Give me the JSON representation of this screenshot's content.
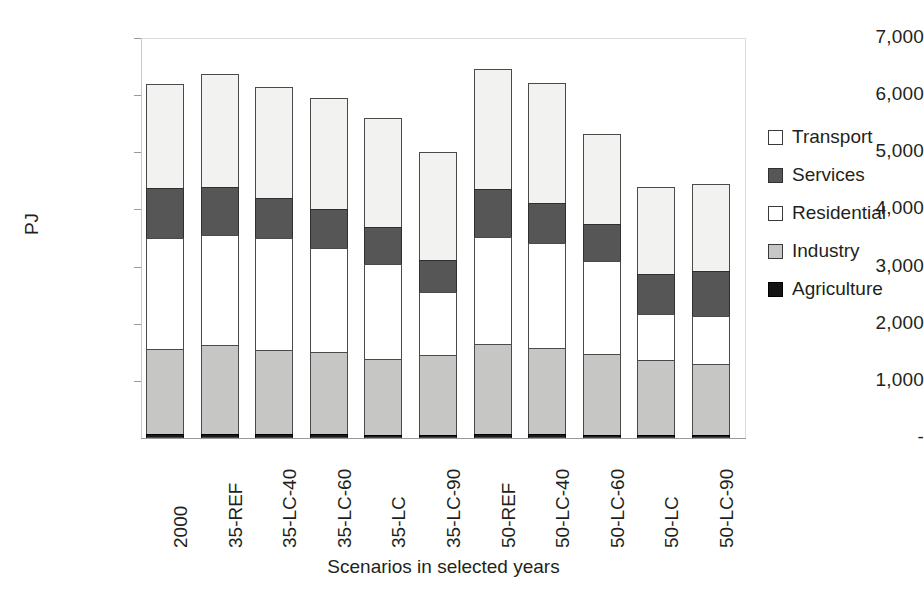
{
  "chart_data": {
    "type": "bar",
    "subtype": "stacked-bar",
    "title": "",
    "xlabel": "Scenarios in selected years",
    "ylabel": "PJ",
    "units": "PJ",
    "ylim": [
      0,
      7000
    ],
    "ytick_values": [
      0,
      1000,
      2000,
      3000,
      4000,
      5000,
      6000,
      7000
    ],
    "ytick_labels": [
      "-",
      "1,000",
      "2,000",
      "3,000",
      "4,000",
      "5,000",
      "6,000",
      "7,000"
    ],
    "grid": false,
    "legend_position": "right",
    "legend_order_top_to_bottom": [
      "Transport",
      "Services",
      "Residential",
      "Industry",
      "Agriculture"
    ],
    "stack_order_bottom_to_top": [
      "Agriculture",
      "Industry",
      "Residential",
      "Services",
      "Transport"
    ],
    "categories": [
      "2000",
      "35-REF",
      "35-LC-40",
      "35-LC-60",
      "35-LC",
      "35-LC-90",
      "50-REF",
      "50-LC-40",
      "50-LC-60",
      "50-LC",
      "50-LC-90"
    ],
    "series": [
      {
        "name": "Agriculture",
        "color": "#1a1a1a",
        "values": [
          70,
          70,
          70,
          70,
          60,
          60,
          70,
          70,
          60,
          60,
          60
        ]
      },
      {
        "name": "Industry",
        "color": "#c6c6c5",
        "values": [
          1490,
          1550,
          1470,
          1440,
          1330,
          1390,
          1570,
          1510,
          1410,
          1300,
          1230
        ]
      },
      {
        "name": "Residential",
        "color": "#ffffff",
        "values": [
          1940,
          1930,
          1960,
          1820,
          1660,
          1110,
          1880,
          1830,
          1630,
          810,
          850
        ]
      },
      {
        "name": "Services",
        "color": "#565656",
        "values": [
          875,
          850,
          700,
          670,
          640,
          560,
          840,
          700,
          640,
          700,
          780
        ]
      },
      {
        "name": "Transport",
        "color": "#f2f2f1",
        "values": [
          1825,
          1970,
          1950,
          1950,
          1910,
          1880,
          2090,
          2110,
          1580,
          1530,
          1520
        ]
      }
    ],
    "totals": [
      6200,
      6370,
      6150,
      5950,
      5600,
      5000,
      6450,
      6220,
      5320,
      4400,
      4440
    ]
  },
  "axes": {
    "y": {
      "label": "PJ",
      "ticks": [
        {
          "label": "7,000",
          "value": 7000
        },
        {
          "label": "6,000",
          "value": 6000
        },
        {
          "label": "5,000",
          "value": 5000
        },
        {
          "label": "4,000",
          "value": 4000
        },
        {
          "label": "3,000",
          "value": 3000
        },
        {
          "label": "2,000",
          "value": 2000
        },
        {
          "label": "1,000",
          "value": 1000
        },
        {
          "label": "-",
          "value": 0
        }
      ]
    },
    "x": {
      "title": "Scenarios in selected years",
      "ticks": [
        {
          "label": "2000"
        },
        {
          "label": "35-REF"
        },
        {
          "label": "35-LC-40"
        },
        {
          "label": "35-LC-60"
        },
        {
          "label": "35-LC"
        },
        {
          "label": "35-LC-90"
        },
        {
          "label": "50-REF"
        },
        {
          "label": "50-LC-40"
        },
        {
          "label": "50-LC-60"
        },
        {
          "label": "50-LC"
        },
        {
          "label": "50-LC-90"
        }
      ]
    }
  },
  "legend": {
    "items": [
      {
        "label": "Transport",
        "swatch": "legend-swatch-transport",
        "color": "#ffffff"
      },
      {
        "label": "Services",
        "swatch": "legend-swatch-services",
        "color": "#565656"
      },
      {
        "label": "Residential",
        "swatch": "legend-swatch-residential",
        "color": "#ffffff"
      },
      {
        "label": "Industry",
        "swatch": "legend-swatch-industry",
        "color": "#c6c6c5"
      },
      {
        "label": "Agriculture",
        "swatch": "legend-swatch-agriculture",
        "color": "#141414"
      }
    ]
  }
}
